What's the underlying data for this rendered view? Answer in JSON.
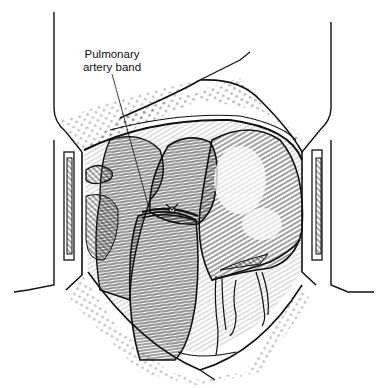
{
  "figure": {
    "labels": [
      {
        "text_line1": "Pulmonary",
        "text_line2": "artery band"
      }
    ],
    "colors": {
      "ink": "#111111",
      "background": "#ffffff"
    }
  }
}
